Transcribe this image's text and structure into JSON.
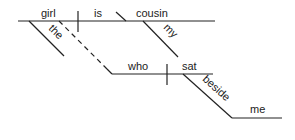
{
  "diagram": {
    "type": "sentence-diagram",
    "words": {
      "subject": "girl",
      "verb": "is",
      "complement": "cousin",
      "subject_modifier": "the",
      "complement_modifier": "my",
      "clause_subject": "who",
      "clause_verb": "sat",
      "preposition": "beside",
      "object": "me"
    },
    "line_color": "#222222"
  }
}
